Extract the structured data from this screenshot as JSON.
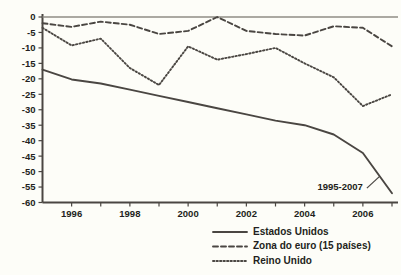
{
  "chart_data": {
    "type": "line",
    "title": "",
    "subtitle": "",
    "xlabel": "",
    "ylabel": "",
    "x": [
      1995,
      1996,
      1997,
      1998,
      1999,
      2000,
      2001,
      2002,
      2003,
      2004,
      2005,
      2006,
      2007
    ],
    "xlim": [
      1995,
      2007
    ],
    "ylim": [
      -60,
      0
    ],
    "ytick_labels": [
      "0",
      "-5",
      "-10",
      "-15",
      "-20",
      "-25",
      "-30",
      "-35",
      "-40",
      "-45",
      "-50",
      "-55",
      "-60"
    ],
    "ytick_values": [
      0,
      -5,
      -10,
      -15,
      -20,
      -25,
      -30,
      -35,
      -40,
      -45,
      -50,
      -55,
      -60
    ],
    "xtick_labels": [
      "1996",
      "1998",
      "2000",
      "2002",
      "2004",
      "2006"
    ],
    "xtick_values": [
      1996,
      1998,
      2000,
      2002,
      2004,
      2006
    ],
    "xminor_ticks": [
      1995,
      1997,
      1999,
      2001,
      2003,
      2005,
      2007
    ],
    "grid": false,
    "zero_reference_line": 0,
    "legend_position": "bottom-right",
    "annotations": [
      {
        "text": "1995-2007",
        "x": 2006,
        "y": -56
      }
    ],
    "series": [
      {
        "name": "Estados Unidos",
        "style": "solid",
        "color": "#4a4642",
        "values": [
          -17.0,
          -20.2,
          -21.5,
          -23.5,
          -25.5,
          -27.5,
          -29.5,
          -31.5,
          -33.5,
          -35.0,
          -38.0,
          -44.0,
          -57.0
        ]
      },
      {
        "name": "Zona do euro (15 países)",
        "style": "dashed",
        "color": "#4a4642",
        "values": [
          -2.0,
          -3.2,
          -1.5,
          -2.5,
          -5.5,
          -4.5,
          0.0,
          -4.5,
          -5.5,
          -6.0,
          -3.0,
          -3.5,
          -9.5
        ]
      },
      {
        "name": "Reino Unido",
        "style": "dotted",
        "color": "#4a4642",
        "values": [
          -3.5,
          -9.2,
          -7.0,
          -16.5,
          -22.0,
          -9.5,
          -13.8,
          -12.0,
          -10.0,
          -15.0,
          -19.5,
          -28.8,
          -25.0
        ]
      }
    ]
  },
  "legend": {
    "items": [
      {
        "label": "Estados Unidos",
        "style": "solid"
      },
      {
        "label": "Zona do euro (15 países)",
        "style": "dashed"
      },
      {
        "label": "Reino Unido",
        "style": "dotted"
      }
    ]
  }
}
